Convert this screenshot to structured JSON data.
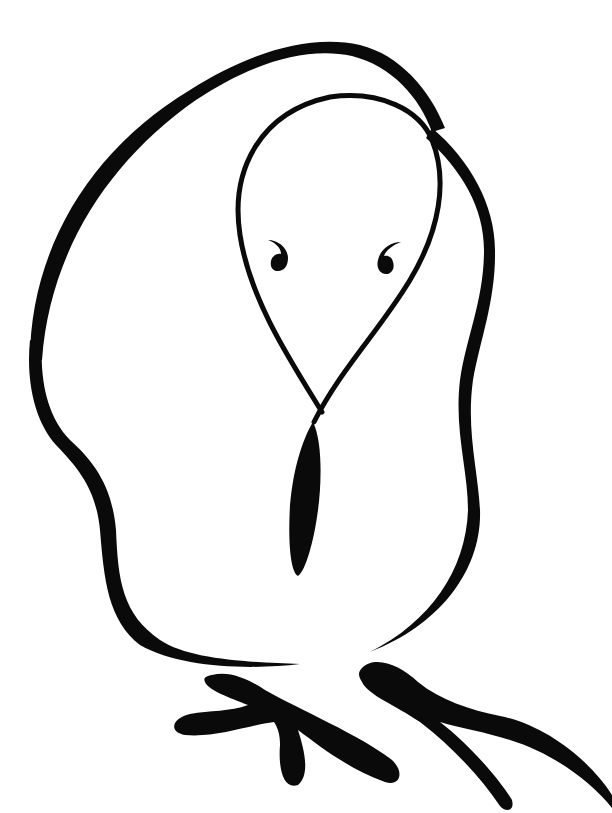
{
  "illustration": {
    "subject": "Line drawing of a bird",
    "style": "black brush ink on white",
    "background_color": "#ffffff",
    "ink_color": "#0a0a0a",
    "parts": [
      {
        "name": "body-outline"
      },
      {
        "name": "head-loop"
      },
      {
        "name": "left-eye"
      },
      {
        "name": "right-eye"
      },
      {
        "name": "beak"
      },
      {
        "name": "left-foot"
      },
      {
        "name": "right-foot"
      }
    ]
  }
}
